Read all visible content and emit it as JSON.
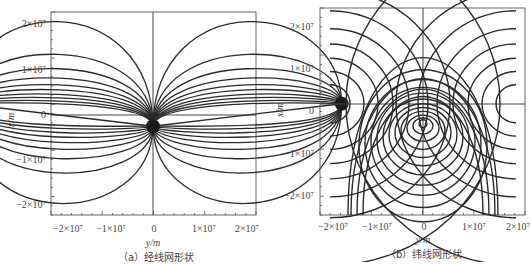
{
  "chart_data": [
    {
      "type": "line",
      "id": "a",
      "title": "(a) 经线网形状",
      "xlabel": "y/m",
      "ylabel": "x/m",
      "xlim": [
        -20000000,
        20000000
      ],
      "ylim": [
        -22000000,
        22000000
      ],
      "xticks": [
        -20000000,
        -10000000,
        0,
        10000000,
        20000000
      ],
      "xtick_labels": [
        "−2×10⁷",
        "−1×10⁷",
        "0",
        "1×10⁷",
        "2×10⁷"
      ],
      "yticks": [
        20000000,
        10000000,
        0,
        -10000000,
        -20000000
      ],
      "ytick_labels": [
        "2×10⁷",
        "1×10⁷",
        "0",
        "−1×10⁷",
        "−2×10⁷"
      ],
      "grid": false,
      "axes_lines": {
        "horizontal_at_x": 0,
        "vertical_at_y": 0
      },
      "convergence_points": [
        {
          "y": -18500000,
          "x": 2500000
        },
        {
          "y": 0,
          "x": -2500000
        },
        {
          "y": 18500000,
          "x": 2500000
        }
      ],
      "description": "Meridian network: family of arcs connecting side poles (±1.85e7, 0.25e7) to central pole (0, -0.25e7); outer arcs peak at x≈2.1e7 (upper) and x≈-2.0e7 (lower).",
      "series": {
        "upper_peaks_x": [
          20800000,
          13500000,
          10300000,
          8200000,
          6700000,
          5600000,
          4600000,
          3800000,
          3100000,
          2500000
        ],
        "lower_troughs_x": [
          -19700000,
          -12900000,
          -9700000,
          -7600000,
          -6100000,
          -4900000,
          -3900000,
          -3000000,
          -2300000
        ]
      }
    },
    {
      "type": "line",
      "id": "b",
      "title": "(b) 纬线网形状",
      "xlabel": "y/m",
      "ylabel": "x/m",
      "xlim": [
        -20000000,
        20000000
      ],
      "ylim": [
        -25000000,
        24000000
      ],
      "xticks": [
        -20000000,
        -10000000,
        0,
        10000000,
        20000000
      ],
      "xtick_labels": [
        "−2×10⁷",
        "−1×10⁷",
        "0",
        "1×10⁷",
        "2×10⁷"
      ],
      "yticks": [
        20000000,
        10000000,
        0,
        -10000000,
        -20000000
      ],
      "ytick_labels": [
        "2×10⁷",
        "1×10⁷",
        "0",
        "−1×10⁷",
        "−2×10⁷"
      ],
      "grid": false,
      "axes_lines": {
        "horizontal_at_x": 1700000,
        "vertical_at_y": 0
      },
      "description": "Parallel network: nested closed ovals around (0,-3e6) plus half-circles around side poles (±2e7, 3e6).",
      "series": {
        "center_arc_top_x": [
          20200000,
          13600000,
          10300000,
          8000000,
          6200000,
          4700000,
          3400000,
          2200000,
          1100000,
          0,
          -1000000,
          -2000000
        ],
        "center_arc_bottom_x": [
          -21600000,
          -13800000,
          -10500000,
          -8300000,
          -6800000,
          -5700000,
          -4800000,
          -4000000
        ],
        "side_arc_radii_y": [
          2000000,
          3400000,
          4800000,
          6300000,
          7900000,
          9800000,
          12000000,
          17000000
        ]
      }
    }
  ],
  "captions": {
    "a": "（a）经线网形状",
    "b": "（b）纬线网形状"
  },
  "axis_labels": {
    "a_x": "y/m",
    "a_y": "x/m",
    "b_x": "y/m",
    "b_y": "x/m"
  },
  "tick_labels": {
    "x": [
      "−2×10⁷",
      "−1×10⁷",
      "0",
      "1×10⁷",
      "2×10⁷"
    ],
    "y": [
      "2×10⁷",
      "1×10⁷",
      "0",
      "−1×10⁷",
      "−2×10⁷"
    ]
  },
  "colors": {
    "curve": "#2a2a2a",
    "frame": "#555555",
    "text": "#444444"
  }
}
